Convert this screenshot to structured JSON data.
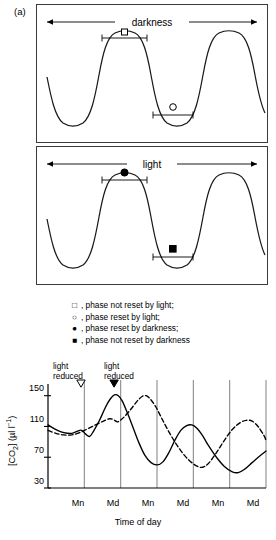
{
  "figure": {
    "panel_a_label": "(a)",
    "panel_b_label": "(b)"
  },
  "panel_a": {
    "top_band_label": "darkness",
    "bottom_band_label": "light",
    "markers": {
      "open_square": "□",
      "open_circle": "○",
      "filled_circle": "●",
      "filled_square": "■"
    },
    "waveform": {
      "description": "flat-topped oscillation, three peaks",
      "peaks": 3,
      "bracket_top_marker": "open-square",
      "bracket_trough_marker": "open-circle",
      "bracket_top_marker_light": "filled-circle",
      "bracket_trough_marker_light": "filled-square"
    }
  },
  "legend": {
    "items": [
      {
        "symbol": "□",
        "text": ", phase not reset by light;"
      },
      {
        "symbol": "○",
        "text": ", phase reset by light;"
      },
      {
        "symbol": "●",
        "text": ", phase reset by darkness;"
      },
      {
        "symbol": "■",
        "text": ", phase not reset by darkness"
      }
    ]
  },
  "annotations": {
    "left": {
      "line1": "light",
      "line2": "reduced",
      "marker": "open-down-triangle"
    },
    "right": {
      "line1": "light",
      "line2": "reduced",
      "marker": "filled-down-triangle"
    }
  },
  "chart_data": {
    "type": "line",
    "title": "",
    "xlabel": "Time of day",
    "ylabel": "[CO2] (µl l−1)",
    "ylabel_parts": {
      "prefix": "[CO",
      "sub": "2",
      "mid": "] (µl l",
      "sup": "−1",
      "suffix": ")"
    },
    "ylim": [
      30,
      160
    ],
    "yticks": [
      30,
      70,
      110,
      150
    ],
    "ytick_labels": [
      "30",
      "70",
      "110",
      "150"
    ],
    "xticks": [
      "Mn",
      "Md",
      "Mn",
      "Md",
      "Mn",
      "Md"
    ],
    "grid": "vertical gridlines at each x tick",
    "legend_position": "none",
    "series": [
      {
        "name": "solid",
        "style": "solid",
        "color": "#000000",
        "points": [
          [
            0.0,
            112
          ],
          [
            0.08,
            106
          ],
          [
            0.16,
            102
          ],
          [
            0.24,
            101
          ],
          [
            0.3,
            104
          ],
          [
            0.34,
            105
          ],
          [
            0.38,
            100
          ],
          [
            0.42,
            97
          ],
          [
            0.46,
            104
          ],
          [
            0.52,
            118
          ],
          [
            0.58,
            135
          ],
          [
            0.63,
            146
          ],
          [
            0.67,
            151
          ],
          [
            0.71,
            150
          ],
          [
            0.75,
            143
          ],
          [
            0.8,
            128
          ],
          [
            0.86,
            108
          ],
          [
            0.92,
            88
          ],
          [
            0.98,
            72
          ],
          [
            1.04,
            63
          ],
          [
            1.1,
            60
          ],
          [
            1.16,
            64
          ],
          [
            1.22,
            76
          ],
          [
            1.28,
            92
          ],
          [
            1.34,
            105
          ],
          [
            1.4,
            111
          ],
          [
            1.45,
            112
          ],
          [
            1.5,
            108
          ],
          [
            1.56,
            98
          ],
          [
            1.62,
            85
          ],
          [
            1.7,
            70
          ],
          [
            1.78,
            58
          ],
          [
            1.86,
            51
          ],
          [
            1.92,
            50
          ],
          [
            1.98,
            54
          ],
          [
            2.06,
            63
          ],
          [
            2.14,
            72
          ],
          [
            2.2,
            78
          ]
        ]
      },
      {
        "name": "dashed",
        "style": "dashed",
        "color": "#000000",
        "points": [
          [
            0.0,
            105
          ],
          [
            0.08,
            101
          ],
          [
            0.16,
            99
          ],
          [
            0.24,
            99
          ],
          [
            0.32,
            102
          ],
          [
            0.4,
            107
          ],
          [
            0.48,
            112
          ],
          [
            0.56,
            117
          ],
          [
            0.62,
            120
          ],
          [
            0.66,
            119
          ],
          [
            0.7,
            116
          ],
          [
            0.74,
            119
          ],
          [
            0.78,
            124
          ],
          [
            0.84,
            133
          ],
          [
            0.9,
            143
          ],
          [
            0.95,
            149
          ],
          [
            0.99,
            150
          ],
          [
            1.03,
            146
          ],
          [
            1.09,
            135
          ],
          [
            1.15,
            120
          ],
          [
            1.22,
            103
          ],
          [
            1.3,
            86
          ],
          [
            1.38,
            72
          ],
          [
            1.45,
            63
          ],
          [
            1.51,
            58
          ],
          [
            1.56,
            57
          ],
          [
            1.62,
            62
          ],
          [
            1.7,
            76
          ],
          [
            1.78,
            92
          ],
          [
            1.86,
            106
          ],
          [
            1.94,
            115
          ],
          [
            2.0,
            118
          ],
          [
            2.06,
            117
          ],
          [
            2.12,
            110
          ],
          [
            2.18,
            98
          ],
          [
            2.2,
            92
          ]
        ]
      }
    ],
    "event_markers": [
      {
        "x": 0.333,
        "label": "light reduced",
        "marker": "open-down-triangle"
      },
      {
        "x": 0.667,
        "label": "light reduced",
        "marker": "filled-down-triangle"
      }
    ]
  }
}
